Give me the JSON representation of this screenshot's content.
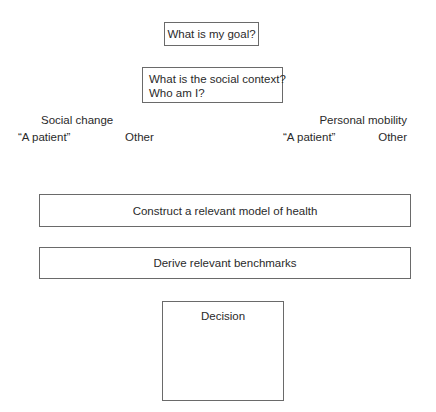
{
  "diagram": {
    "goal_box": "What is my goal?",
    "context_box": {
      "line1": "What is the social context?",
      "line2": "Who am I?"
    },
    "branches": {
      "left": {
        "label": "Social change",
        "options": [
          "“A patient”",
          "Other"
        ]
      },
      "right": {
        "label": "Personal mobility",
        "options": [
          "“A patient”",
          "Other"
        ]
      }
    },
    "model_box": "Construct a relevant model of health",
    "benchmarks_box": "Derive relevant benchmarks",
    "decision_box": "Decision"
  },
  "colors": {
    "border": "#6a6a6a",
    "text": "#2a2a2a",
    "background": "#ffffff"
  }
}
